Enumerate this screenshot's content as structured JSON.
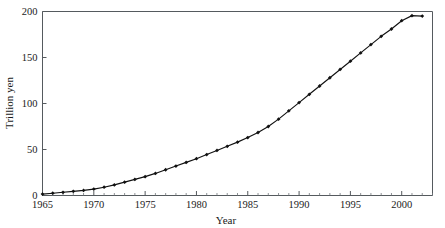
{
  "chart_data": {
    "type": "line",
    "title": "",
    "xlabel": "Year",
    "ylabel": "Trillion yen",
    "xlim": [
      1965,
      2003
    ],
    "ylim": [
      0,
      200
    ],
    "grid": false,
    "legend": null,
    "marker": "diamond",
    "line_color": "#111111",
    "x": [
      1965,
      1966,
      1967,
      1968,
      1969,
      1970,
      1971,
      1972,
      1973,
      1974,
      1975,
      1976,
      1977,
      1978,
      1979,
      1980,
      1981,
      1982,
      1983,
      1984,
      1985,
      1986,
      1987,
      1988,
      1989,
      1990,
      1991,
      1992,
      1993,
      1994,
      1995,
      1996,
      1997,
      1998,
      1999,
      2000,
      2001,
      2002
    ],
    "values": [
      1.5,
      2.5,
      3.5,
      4.5,
      5.5,
      7.0,
      9.0,
      11.5,
      14.5,
      17.5,
      20.5,
      24.0,
      28.0,
      32.0,
      36.0,
      40.0,
      44.5,
      49.0,
      53.5,
      58.0,
      63.0,
      68.5,
      75.0,
      83.0,
      92.0,
      101.0,
      110.0,
      119.0,
      128.0,
      137.0,
      146.0,
      155.0,
      164.0,
      173.0,
      181.0,
      190.0,
      195.5,
      195.0
    ],
    "xticks": [
      1965,
      1970,
      1975,
      1980,
      1985,
      1990,
      1995,
      2000
    ],
    "xtick_labels": [
      "1965",
      "1970",
      "1975",
      "1980",
      "1985",
      "1990",
      "1995",
      "2000"
    ],
    "yticks": [
      0,
      50,
      100,
      150,
      200
    ],
    "ytick_labels": [
      "0",
      "50",
      "100",
      "150",
      "200"
    ],
    "x_minor_step": 1,
    "axis_color": "#555a5e"
  }
}
